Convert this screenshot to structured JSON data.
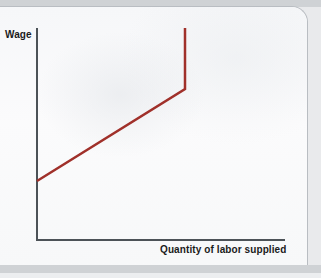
{
  "figure": {
    "kind": "economics-textbook-figure",
    "background_color": "#f8f9fa",
    "page_color": "#e9eaec"
  },
  "axes": {
    "y_label": "Wage",
    "x_label": "Quantity of labor supplied",
    "axis_color": "#4c5257"
  },
  "chart_data": {
    "type": "line",
    "title": "",
    "subtitle": "",
    "xlabel": "Quantity of labor supplied",
    "ylabel": "Wage",
    "xlim": [
      0,
      100
    ],
    "ylim": [
      0,
      100
    ],
    "grid": false,
    "legend": null,
    "annotations": [],
    "series": [
      {
        "name": "Backward-bending labor supply curve",
        "color": "#a0302a",
        "line_width": 2.5,
        "x": [
          0,
          60,
          60
        ],
        "y": [
          28,
          71,
          100
        ],
        "description": "Upward sloping segment that becomes vertical at high wage"
      }
    ],
    "points_pixel": {
      "start": [
        37,
        181
      ],
      "kink": [
        185,
        89
      ],
      "top": [
        185,
        28
      ]
    }
  }
}
